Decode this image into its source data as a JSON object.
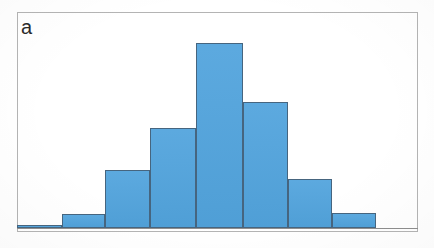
{
  "figure": {
    "panel_label": "a",
    "frame_color": "#b4b4b4",
    "background_color": "#ffffff"
  },
  "chart_data": {
    "type": "bar",
    "title": "",
    "subtitle": "",
    "xlabel": "",
    "ylabel": "",
    "panel_label": "a",
    "categories": [
      "1",
      "2",
      "3",
      "4",
      "5",
      "6",
      "7",
      "8"
    ],
    "values": [
      3,
      14,
      58,
      100,
      185,
      126,
      49,
      15
    ],
    "ylim": [
      0,
      200
    ],
    "xlim": [
      0,
      8
    ],
    "grid": false,
    "legend": null,
    "legend_position": "none",
    "axis_tick_labels_x": [],
    "axis_tick_labels_y": [],
    "bar_fill_color": "#52a4dd",
    "bar_edge_color": "#46657f",
    "bar_gap": 0,
    "bars": [
      {
        "name": "bin-1",
        "value": 3,
        "x_start_pct": 0.0,
        "width_pct": 11.22
      },
      {
        "name": "bin-2",
        "value": 14,
        "x_start_pct": 11.22,
        "width_pct": 10.72
      },
      {
        "name": "bin-3",
        "value": 58,
        "x_start_pct": 21.94,
        "width_pct": 11.22
      },
      {
        "name": "bin-4",
        "value": 100,
        "x_start_pct": 33.16,
        "width_pct": 11.47
      },
      {
        "name": "bin-5",
        "value": 185,
        "x_start_pct": 44.63,
        "width_pct": 11.72
      },
      {
        "name": "bin-6",
        "value": 126,
        "x_start_pct": 56.35,
        "width_pct": 11.22
      },
      {
        "name": "bin-7",
        "value": 49,
        "x_start_pct": 67.57,
        "width_pct": 10.97
      },
      {
        "name": "bin-8",
        "value": 15,
        "x_start_pct": 78.54,
        "width_pct": 10.97
      }
    ]
  }
}
